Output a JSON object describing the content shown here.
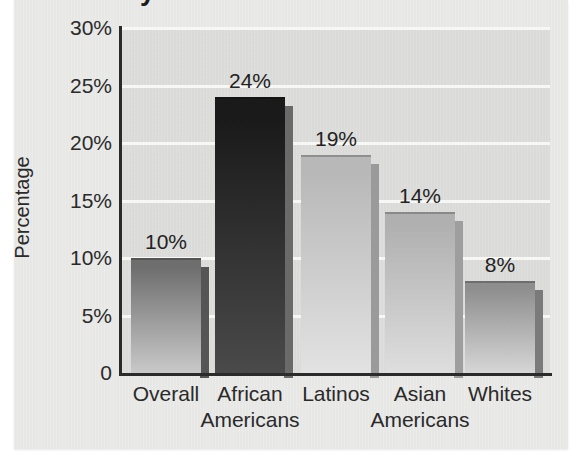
{
  "figure": {
    "title_fragment": "Ry",
    "background_color": "#e9e9e7",
    "plot_background_color": "#dcdcda",
    "gridline_color": "#f7f7f6",
    "axis_color": "#2b2b2b"
  },
  "chart_data": {
    "type": "bar",
    "title": "",
    "xlabel": "",
    "ylabel": "Percentage",
    "categories": [
      "Overall",
      "African Americans",
      "Latinos",
      "Asian Americans",
      "Whites"
    ],
    "category_lines": [
      {
        "line1": "Overall",
        "line2": ""
      },
      {
        "line1": "African",
        "line2": "Americans"
      },
      {
        "line1": "Latinos",
        "line2": ""
      },
      {
        "line1": "Asian",
        "line2": "Americans"
      },
      {
        "line1": "Whites",
        "line2": ""
      }
    ],
    "values": [
      10,
      24,
      19,
      14,
      8
    ],
    "value_labels": [
      "10%",
      "24%",
      "19%",
      "14%",
      "8%"
    ],
    "ylim": [
      0,
      30
    ],
    "ytick_values": [
      0,
      5,
      10,
      15,
      20,
      25,
      30
    ],
    "ytick_labels": [
      "0",
      "5%",
      "10%",
      "15%",
      "20%",
      "25%",
      "30%"
    ],
    "grid": true,
    "legend": "none",
    "bar_colors": [
      "#6e6e6e",
      "#1a1a1a",
      "#b8b8b8",
      "#b0b0b0",
      "#8e8e8e"
    ],
    "bar_colors_bottom": [
      "#c9c9c9",
      "#4a4a4a",
      "#e2e2e2",
      "#dedede",
      "#d6d6d6"
    ],
    "bar_shadow_colors": [
      "#555555",
      "#6a6a6a",
      "#9a9a9a",
      "#9e9e9e",
      "#7a7a7a"
    ],
    "geometry": {
      "plot_left": 122,
      "plot_top": 28,
      "plot_width": 428,
      "plot_height": 345,
      "bar_width": 70,
      "bar_centers": [
        166,
        250,
        336,
        420,
        500
      ]
    }
  }
}
